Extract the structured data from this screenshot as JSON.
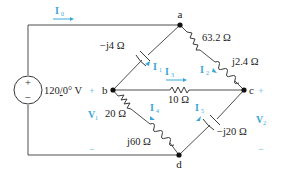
{
  "colors": {
    "wire": "#3a3a3a",
    "current_label": "#3aa6d8",
    "polarity": "#7fc4e6"
  },
  "source": {
    "value": "120",
    "angle": "0°",
    "unit": "V",
    "plus": "+",
    "minus": "−"
  },
  "nodes": {
    "a": "a",
    "b": "b",
    "c": "c",
    "d": "d"
  },
  "components": {
    "cap_ab": "−j4 Ω",
    "res_ac": "63.2 Ω",
    "ind_ac": "j2.4 Ω",
    "res_bc": "10 Ω",
    "res_bd": "20 Ω",
    "ind_bd": "j60 Ω",
    "cap_cd": "−j20 Ω"
  },
  "currents": {
    "I0": {
      "main": "I",
      "sub": "0"
    },
    "I1": {
      "main": "I",
      "sub": "1"
    },
    "I2": {
      "main": "I",
      "sub": "2"
    },
    "I3": {
      "main": "I",
      "sub": "3"
    },
    "I4": {
      "main": "I",
      "sub": "4"
    },
    "I5": {
      "main": "I",
      "sub": "5"
    }
  },
  "voltages": {
    "V1": {
      "main": "V",
      "sub": "1",
      "plus": "+",
      "minus": "−"
    },
    "V2": {
      "main": "V",
      "sub": "2",
      "plus": "+",
      "minus": "−"
    }
  }
}
